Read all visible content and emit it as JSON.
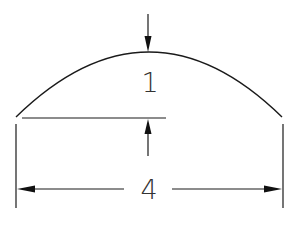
{
  "diagram": {
    "title": "",
    "shape": "circular-segment-arc",
    "labels": {
      "height": "1",
      "width": "4"
    },
    "colors": {
      "line": "#1a1a1a",
      "text": "#333333",
      "background": "#ffffff"
    }
  }
}
